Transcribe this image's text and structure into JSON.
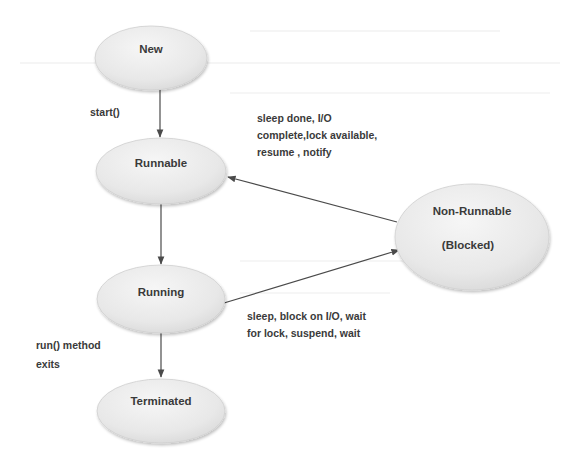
{
  "diagram": {
    "colors": {
      "background": "#ffffff",
      "node_fill": "#e6e6e6",
      "node_fill_light": "#f4f4f4",
      "node_stroke": "#c9c9c9",
      "edge": "#4a4a4a",
      "text": "#3a3a3a"
    },
    "nodes": {
      "new": {
        "label": "New",
        "cx": 151,
        "cy": 58,
        "rx": 56,
        "ry": 32
      },
      "runnable": {
        "label": "Runnable",
        "cx": 161,
        "cy": 171,
        "rx": 65,
        "ry": 33
      },
      "running": {
        "label": "Running",
        "cx": 161,
        "cy": 299,
        "rx": 64,
        "ry": 34
      },
      "terminated": {
        "label": "Terminated",
        "cx": 161,
        "cy": 411,
        "rx": 64,
        "ry": 32
      },
      "non_runnable": {
        "label_line1": "Non-Runnable",
        "label_line2": "(Blocked)",
        "cx": 472,
        "cy": 237,
        "rx": 77,
        "ry": 53
      }
    },
    "edges": [
      {
        "from": "New",
        "to": "Runnable",
        "label_lines": [
          "start()"
        ]
      },
      {
        "from": "Non-Runnable",
        "to": "Runnable",
        "label_lines": [
          "sleep done, I/O",
          "complete,lock available,",
          "resume , notify"
        ]
      },
      {
        "from": "Runnable",
        "to": "Running",
        "label_lines": []
      },
      {
        "from": "Running",
        "to": "Non-Runnable",
        "label_lines": [
          "sleep, block on I/O, wait",
          "for lock, suspend,  wait"
        ]
      },
      {
        "from": "Running",
        "to": "Terminated",
        "label_lines": [
          "run() method",
          "exits"
        ]
      }
    ],
    "edge_labels": {
      "start": "start()",
      "unblock_1": "sleep done, I/O",
      "unblock_2": "complete,lock available,",
      "unblock_3": "resume , notify",
      "block_1": "sleep, block on I/O, wait",
      "block_2": "for lock, suspend,  wait",
      "exit_1": "run() method",
      "exit_2": "exits"
    }
  }
}
